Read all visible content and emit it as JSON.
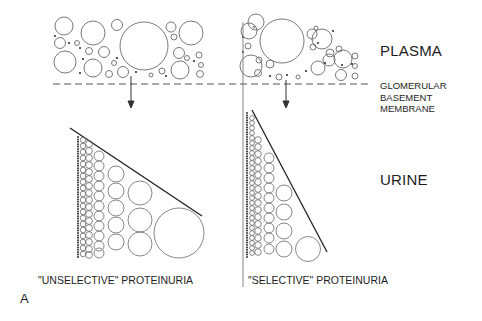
{
  "labels": {
    "plasma": "PLASMA",
    "membrane_line1": "GLOMERULAR",
    "membrane_line2": "BASEMENT",
    "membrane_line3": "MEMBRANE",
    "urine": "URINE",
    "left_caption": "\"UNSELECTIVE\" PROTEINURIA",
    "right_caption": "\"SELECTIVE\" PROTEINURIA",
    "panel_letter": "A"
  },
  "diagram": {
    "stroke_color": "#555555",
    "panels": [
      {
        "name": "unselective",
        "description": "All protein sizes pass membrane; sizes graded from tiny to large"
      },
      {
        "name": "selective",
        "description": "Mainly small proteins pass membrane; few large"
      }
    ]
  }
}
